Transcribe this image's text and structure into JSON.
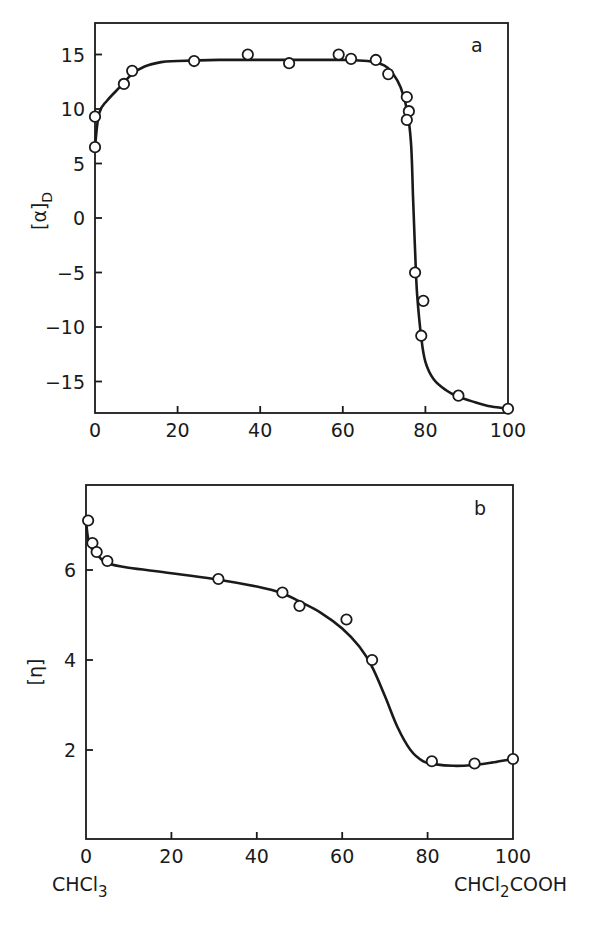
{
  "chart_data": [
    {
      "panel": "a",
      "type": "line",
      "title": "",
      "panel_label": "a",
      "xlabel": "",
      "ylabel": "[α]D",
      "ylabel_main": "[α]",
      "ylabel_sub": "D",
      "xlim": [
        0,
        100
      ],
      "ylim": [
        -18,
        18
      ],
      "xticks": [
        0,
        20,
        40,
        60,
        80,
        100
      ],
      "xtick_labels": [
        "0",
        "20",
        "40",
        "60",
        "80",
        "100"
      ],
      "yticks": [
        15,
        10,
        5,
        0,
        -5,
        -10,
        -15
      ],
      "ytick_labels": [
        "15",
        "10",
        "5",
        "0",
        "-5",
        "-10",
        "-15"
      ],
      "grid": false,
      "legend": null,
      "series": [
        {
          "name": "measured points",
          "marker": "open-circle",
          "x": [
            0,
            0,
            7,
            9,
            24,
            37,
            47,
            59,
            62,
            68,
            71,
            75.5,
            76,
            75.5,
            77.5,
            79.5,
            79,
            88,
            100
          ],
          "y": [
            6.5,
            9.3,
            12.3,
            13.5,
            14.4,
            15.0,
            14.2,
            15.0,
            14.6,
            14.5,
            13.2,
            11.1,
            9.8,
            9.0,
            -5.0,
            -7.6,
            -10.8,
            -16.3,
            -17.5
          ]
        },
        {
          "name": "smooth fit curve",
          "marker": "none",
          "x": [
            0,
            1,
            3,
            6,
            9,
            12,
            16,
            20,
            30,
            40,
            50,
            60,
            66,
            70,
            72,
            74,
            75.5,
            76.5,
            77,
            77.5,
            78,
            79,
            80,
            82,
            85,
            88,
            92,
            96,
            100
          ],
          "y": [
            6.5,
            9.6,
            10.8,
            12.0,
            13.2,
            13.9,
            14.3,
            14.4,
            14.5,
            14.5,
            14.5,
            14.5,
            14.4,
            14.0,
            13.3,
            12.0,
            10.0,
            7.0,
            2.0,
            -3.0,
            -7.0,
            -11.0,
            -13.2,
            -14.8,
            -15.8,
            -16.4,
            -16.9,
            -17.3,
            -17.5
          ]
        }
      ]
    },
    {
      "panel": "b",
      "type": "line",
      "title": "",
      "panel_label": "b",
      "xlabel": "",
      "x_left_label": "CHCl3",
      "x_left_main": "CHCl",
      "x_left_sub": "3",
      "x_right_label": "CHCl2COOH",
      "x_right_main_1": "CHCl",
      "x_right_sub": "2",
      "x_right_main_2": "COOH",
      "ylabel": "[η]",
      "xlim": [
        0,
        100
      ],
      "ylim": [
        0,
        7.5
      ],
      "xticks": [
        0,
        20,
        40,
        60,
        80,
        100
      ],
      "xtick_labels": [
        "0",
        "20",
        "40",
        "60",
        "80",
        "100"
      ],
      "yticks": [
        6,
        4,
        2
      ],
      "ytick_labels": [
        "6",
        "4",
        "2"
      ],
      "grid": false,
      "legend": null,
      "series": [
        {
          "name": "measured points",
          "marker": "open-circle",
          "x": [
            0.5,
            1.5,
            2.5,
            5,
            31,
            46,
            50,
            61,
            67,
            81,
            91,
            100
          ],
          "y": [
            7.1,
            6.6,
            6.4,
            6.2,
            5.8,
            5.5,
            5.2,
            4.9,
            4.0,
            1.75,
            1.7,
            1.8
          ]
        },
        {
          "name": "smooth fit curve",
          "marker": "none",
          "x": [
            0,
            0.5,
            1.5,
            3,
            5,
            10,
            20,
            30,
            40,
            46,
            50,
            55,
            60,
            64,
            67,
            70,
            73,
            76,
            79,
            82,
            86,
            90,
            95,
            100
          ],
          "y": [
            7.1,
            6.7,
            6.45,
            6.3,
            6.15,
            6.05,
            5.93,
            5.8,
            5.63,
            5.48,
            5.3,
            5.05,
            4.7,
            4.3,
            3.85,
            3.2,
            2.5,
            2.0,
            1.75,
            1.68,
            1.65,
            1.66,
            1.72,
            1.8
          ]
        }
      ]
    }
  ]
}
